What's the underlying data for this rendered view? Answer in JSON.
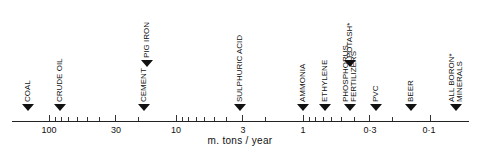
{
  "chart_data": {
    "type": "scatter",
    "title": "",
    "xlabel": "m. tons / year",
    "ylabel": "",
    "xscale": "log",
    "xaxis_reversed": true,
    "xlim": [
      200,
      0.06
    ],
    "grid": false,
    "legend": null,
    "tick_labels": [
      "100",
      "30",
      "10",
      "3",
      "1",
      "0·3",
      "0·1"
    ],
    "tick_values": [
      100,
      30,
      10,
      3,
      1,
      0.3,
      0.1
    ],
    "points": [
      {
        "label": "COAL",
        "value": 150,
        "row": "lower"
      },
      {
        "label": "CRUDE OIL",
        "value": 85,
        "row": "lower"
      },
      {
        "label": "CEMENT",
        "value": 19,
        "row": "lower"
      },
      {
        "label": "PIG IRON",
        "value": 18,
        "row": "upper"
      },
      {
        "label": "SULPHURIC ACID",
        "value": 3.1,
        "row": "lower"
      },
      {
        "label": "AMMONIA",
        "value": 1.0,
        "row": "lower"
      },
      {
        "label": "ETHYLENE",
        "value": 0.67,
        "row": "lower"
      },
      {
        "label": "PHOSPHORUS FERTILIZERS",
        "value": 0.43,
        "row": "lower"
      },
      {
        "label": "POTASH*",
        "value": 0.43,
        "row": "upper"
      },
      {
        "label": "PVC",
        "value": 0.27,
        "row": "lower"
      },
      {
        "label": "BEER",
        "value": 0.14,
        "row": "lower"
      },
      {
        "label": "ALL BORON* MINERALS",
        "value": 0.063,
        "row": "lower"
      }
    ]
  },
  "axis": {
    "title": "m. tons / year",
    "labels": [
      {
        "text": "100",
        "x": 49
      },
      {
        "text": "30",
        "x": 116
      },
      {
        "text": "10",
        "x": 176
      },
      {
        "text": "3",
        "x": 243
      },
      {
        "text": "1",
        "x": 303
      },
      {
        "text": "0·3",
        "x": 370
      },
      {
        "text": "0·1",
        "x": 429
      }
    ]
  },
  "markers": [
    {
      "label": "COAL",
      "x": 28,
      "y": 104
    },
    {
      "label": "CRUDE OIL",
      "x": 60,
      "y": 104
    },
    {
      "label": "CEMENT",
      "x": 144,
      "y": 104
    },
    {
      "label": "PIG IRON",
      "x": 147,
      "y": 60
    },
    {
      "label": "SULPHURIC ACID",
      "x": 240,
      "y": 104
    },
    {
      "label": "AMMONIA",
      "x": 303,
      "y": 104
    },
    {
      "label": "ETHYLENE",
      "x": 325,
      "y": 104
    },
    {
      "label": "PHOSPHORUS\nFERTILIZERS",
      "x": 350,
      "y": 104
    },
    {
      "label": "POTASH*",
      "x": 350,
      "y": 60
    },
    {
      "label": "PVC",
      "x": 376,
      "y": 104
    },
    {
      "label": "BEER",
      "x": 411,
      "y": 104
    },
    {
      "label": "ALL BORON*\nMINERALS",
      "x": 456,
      "y": 104
    }
  ]
}
